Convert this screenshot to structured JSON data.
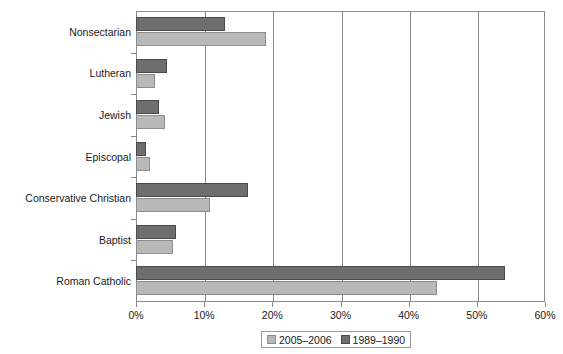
{
  "chart_data": {
    "type": "bar",
    "orientation": "horizontal",
    "title": "",
    "xlabel": "",
    "ylabel": "",
    "xlim": [
      0,
      60
    ],
    "xtick_labels": [
      "0%",
      "10%",
      "20%",
      "30%",
      "40%",
      "50%",
      "60%"
    ],
    "xticks": [
      0,
      10,
      20,
      30,
      40,
      50,
      60
    ],
    "grid": "vertical",
    "legend_position": "bottom",
    "categories": [
      "Nonsectarian",
      "Lutheran",
      "Jewish",
      "Episcopal",
      "Conservative Christian",
      "Baptist",
      "Roman Catholic"
    ],
    "series": [
      {
        "name": "1989–1990",
        "color": "#6e6e6e",
        "border_color": "#4a4a4a",
        "values": [
          13.0,
          4.5,
          3.4,
          1.5,
          16.4,
          5.9,
          54.1
        ]
      },
      {
        "name": "2005–2006",
        "color": "#b8b8b8",
        "border_color": "#8d8d8d",
        "values": [
          19.0,
          2.8,
          4.3,
          2.0,
          10.8,
          5.5,
          44.1
        ]
      }
    ],
    "legend": [
      {
        "label": "2005–2006",
        "swatch": "light"
      },
      {
        "label": "1989–1990",
        "swatch": "dark"
      }
    ]
  }
}
